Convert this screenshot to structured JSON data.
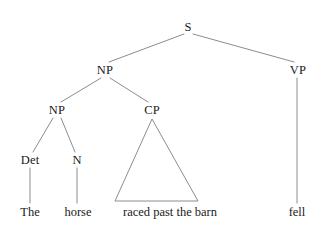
{
  "diagram": {
    "sentence": "The horse raced past the barn fell",
    "stroke_color": "#8c8c8c",
    "text_color": "#1a1a1a",
    "background_color": "#ffffff",
    "width": 327,
    "height": 229
  },
  "nodes": {
    "s": {
      "label": "S",
      "x": 188,
      "y": 27
    },
    "np_top": {
      "label": "NP",
      "x": 105,
      "y": 70
    },
    "vp": {
      "label": "VP",
      "x": 298,
      "y": 70
    },
    "np_inner": {
      "label": "NP",
      "x": 57,
      "y": 110
    },
    "cp": {
      "label": "CP",
      "x": 152,
      "y": 110
    },
    "det": {
      "label": "Det",
      "x": 30,
      "y": 160
    },
    "n": {
      "label": "N",
      "x": 77,
      "y": 160
    }
  },
  "terminals": {
    "the": {
      "label": "The",
      "x": 30,
      "y": 212
    },
    "horse": {
      "label": "horse",
      "x": 78,
      "y": 212
    },
    "phrase": {
      "label": "raced past the barn",
      "x": 170,
      "y": 212
    },
    "fell": {
      "label": "fell",
      "x": 297,
      "y": 212
    }
  },
  "edges": [
    {
      "name": "s-to-np",
      "x1": 184,
      "y1": 34,
      "x2": 109,
      "y2": 62
    },
    {
      "name": "s-to-vp",
      "x1": 193,
      "y1": 34,
      "x2": 294,
      "y2": 62
    },
    {
      "name": "np-to-np",
      "x1": 101,
      "y1": 78,
      "x2": 61,
      "y2": 102
    },
    {
      "name": "np-to-cp",
      "x1": 110,
      "y1": 78,
      "x2": 148,
      "y2": 102
    },
    {
      "name": "np-to-det",
      "x1": 53,
      "y1": 118,
      "x2": 33,
      "y2": 152
    },
    {
      "name": "np-to-n",
      "x1": 61,
      "y1": 118,
      "x2": 75,
      "y2": 152
    },
    {
      "name": "det-to-the",
      "x1": 30,
      "y1": 168,
      "x2": 30,
      "y2": 203
    },
    {
      "name": "n-to-horse",
      "x1": 77,
      "y1": 168,
      "x2": 77,
      "y2": 203
    },
    {
      "name": "vp-to-fell",
      "x1": 297,
      "y1": 78,
      "x2": 297,
      "y2": 203
    }
  ],
  "triangle": {
    "name": "cp-triangle",
    "apex_x": 152,
    "apex_y": 119,
    "base_left_x": 115,
    "base_right_x": 198,
    "base_y": 201
  }
}
